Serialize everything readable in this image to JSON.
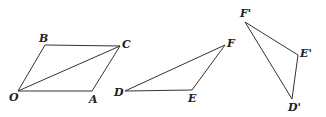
{
  "figures": [
    {
      "name": "parallelogram-OACB",
      "points": {
        "O": [
          18,
          91
        ],
        "A": [
          92,
          91
        ],
        "C": [
          120,
          46
        ],
        "B": [
          45,
          45
        ]
      },
      "diagonal": [
        "O",
        "C"
      ]
    },
    {
      "name": "triangle-DEF",
      "points": {
        "D": [
          125,
          91
        ],
        "E": [
          192,
          90
        ],
        "F": [
          225,
          45
        ]
      }
    },
    {
      "name": "triangle-D'E'F'",
      "points": {
        "F'": [
          245,
          22
        ],
        "E'": [
          298,
          55
        ],
        "D'": [
          292,
          99
        ]
      }
    }
  ],
  "labels": {
    "O": "O",
    "A": "A",
    "B": "B",
    "C": "C",
    "D": "D",
    "E": "E",
    "F": "F",
    "Fp": "F'",
    "Ep": "E'",
    "Dp": "D'"
  },
  "colors": {
    "stroke": "#333333",
    "background": "#ffffff"
  }
}
